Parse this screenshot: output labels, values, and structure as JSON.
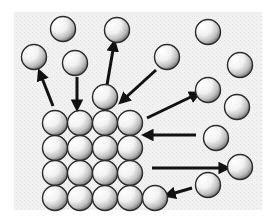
{
  "diagram": {
    "type": "particle-lattice",
    "colors": {
      "page_background": "#ffffff",
      "panel_background": "#efefef",
      "ball_highlight": "#ffffff",
      "ball_mid": "#d8d8d8",
      "ball_shadow": "#6a6a6a",
      "ball_outline": "#2a2a2a",
      "arrow": "#111111"
    },
    "panel": {
      "x": 14,
      "y": 12,
      "width": 248,
      "height": 198
    },
    "ball_radius": 12.5,
    "lattice": {
      "columns_x": [
        55,
        80,
        105,
        130
      ],
      "rows_y": [
        123,
        148,
        173,
        198
      ]
    },
    "loose_balls": [
      {
        "id": "b1",
        "x": 63,
        "y": 29
      },
      {
        "id": "b2",
        "x": 117,
        "y": 30
      },
      {
        "id": "b3",
        "x": 208,
        "y": 32
      },
      {
        "id": "b4",
        "x": 34,
        "y": 57
      },
      {
        "id": "b5",
        "x": 167,
        "y": 57
      },
      {
        "id": "b6",
        "x": 75,
        "y": 63
      },
      {
        "id": "b7",
        "x": 240,
        "y": 65
      },
      {
        "id": "b8",
        "x": 208,
        "y": 90
      },
      {
        "id": "b9",
        "x": 105,
        "y": 97
      },
      {
        "id": "b10",
        "x": 237,
        "y": 107
      },
      {
        "id": "b11",
        "x": 216,
        "y": 138
      },
      {
        "id": "b12",
        "x": 240,
        "y": 167
      },
      {
        "id": "b13",
        "x": 208,
        "y": 185
      },
      {
        "id": "b14",
        "x": 155,
        "y": 198
      }
    ],
    "arrows": [
      {
        "id": "a1",
        "direction": "leaving",
        "x1": 53,
        "y1": 106,
        "x2": 40,
        "y2": 73
      },
      {
        "id": "a2",
        "direction": "arriving",
        "x1": 77,
        "y1": 77,
        "x2": 77,
        "y2": 107
      },
      {
        "id": "a3",
        "direction": "leaving",
        "x1": 107,
        "y1": 85,
        "x2": 114,
        "y2": 44
      },
      {
        "id": "a4",
        "direction": "arriving",
        "x1": 156,
        "y1": 70,
        "x2": 122,
        "y2": 101
      },
      {
        "id": "a5",
        "direction": "leaving",
        "x1": 147,
        "y1": 118,
        "x2": 197,
        "y2": 94
      },
      {
        "id": "a6",
        "direction": "arriving",
        "x1": 196,
        "y1": 135,
        "x2": 146,
        "y2": 135
      },
      {
        "id": "a7",
        "direction": "leaving",
        "x1": 152,
        "y1": 168,
        "x2": 226,
        "y2": 168
      },
      {
        "id": "a8",
        "direction": "arriving",
        "x1": 192,
        "y1": 188,
        "x2": 168,
        "y2": 195
      }
    ]
  }
}
